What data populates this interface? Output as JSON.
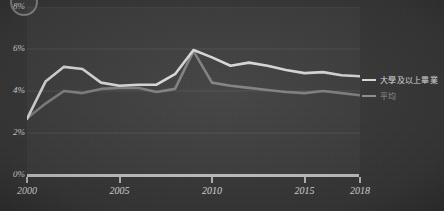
{
  "figure": {
    "corner_mark": "circle-mark",
    "background_color": "#3a3a3a",
    "panel_color": "#404040"
  },
  "legend": {
    "position": "right",
    "items": [
      {
        "label": "大學及以上畢業",
        "color": "#e8e8e8",
        "name": "series-college-grad"
      },
      {
        "label": "平均",
        "color": "#9a9a9a",
        "name": "series-average"
      }
    ]
  },
  "chart_data": {
    "type": "line",
    "title": "",
    "subtitle": "",
    "xlabel": "",
    "ylabel": "",
    "grid": true,
    "legend_position": "right",
    "xlim": [
      2000,
      2018
    ],
    "ylim": [
      0,
      8
    ],
    "ytick_labels": [
      "0%",
      "2%",
      "4%",
      "6%",
      "8%"
    ],
    "ytick_values": [
      0,
      2,
      4,
      6,
      8
    ],
    "xtick_labels": [
      "2000",
      "2005",
      "2010",
      "2015",
      "2018"
    ],
    "xtick_values": [
      2000,
      2005,
      2010,
      2015,
      2018
    ],
    "x": [
      2000,
      2001,
      2002,
      2003,
      2004,
      2005,
      2006,
      2007,
      2008,
      2009,
      2010,
      2011,
      2012,
      2013,
      2014,
      2015,
      2016,
      2017,
      2018
    ],
    "series": [
      {
        "name": "大學及以上畢業",
        "color": "#e8e8e8",
        "values": [
          2.67,
          4.45,
          5.15,
          5.05,
          4.4,
          4.25,
          4.3,
          4.3,
          4.8,
          5.95,
          5.6,
          5.2,
          5.35,
          5.2,
          5.0,
          4.85,
          4.9,
          4.75,
          4.7
        ]
      },
      {
        "name": "平均",
        "color": "#9a9a9a",
        "values": [
          2.7,
          3.4,
          4.0,
          3.9,
          4.1,
          4.15,
          4.15,
          3.95,
          4.1,
          5.9,
          4.4,
          4.25,
          4.15,
          4.05,
          3.95,
          3.9,
          4.0,
          3.9,
          3.8
        ]
      }
    ]
  }
}
